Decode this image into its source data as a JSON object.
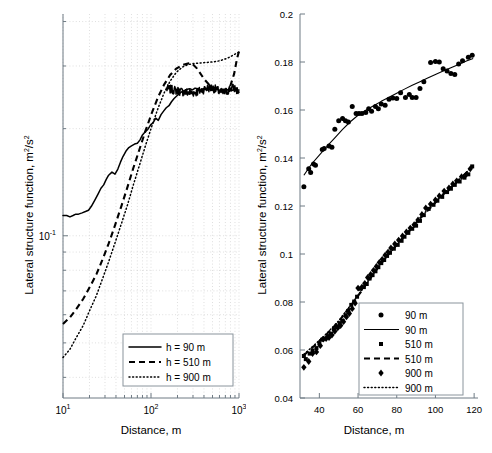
{
  "figure": {
    "panels": [
      "left-loglog-panel",
      "right-linear-panel"
    ]
  },
  "left_panel": {
    "xlabel": "Distance, m",
    "ylabel": "Lateral structure function, m",
    "ylabel_exp": "2",
    "ylabel_tail": "/s",
    "ylabel_exp2": "2",
    "xticks": [
      "10",
      "10",
      "10"
    ],
    "xtick_exps": [
      "1",
      "2",
      "3"
    ],
    "ytick": "10",
    "ytick_exp": "-1",
    "legend": [
      {
        "label": "h =  90 m",
        "style": "solid"
      },
      {
        "label": "h = 510 m",
        "style": "dashed"
      },
      {
        "label": "h = 900 m",
        "style": "dotted"
      }
    ]
  },
  "right_panel": {
    "xlabel": "Distance, m",
    "ylabel": "Lateral structure function, m",
    "ylabel_exp": "2",
    "ylabel_tail": "/s",
    "ylabel_exp2": "2",
    "xticks": [
      "40",
      "60",
      "80",
      "100",
      "120"
    ],
    "yticks": [
      "0.04",
      "0.06",
      "0.08",
      "0.1",
      "0.12",
      "0.14",
      "0.16",
      "0.18",
      "0.2"
    ],
    "legend": [
      {
        "label": "90 m",
        "style": "circle-marker"
      },
      {
        "label": "90 m",
        "style": "solid"
      },
      {
        "label": "510 m",
        "style": "square-marker"
      },
      {
        "label": "510 m",
        "style": "dashed"
      },
      {
        "label": "900 m",
        "style": "diamond-marker"
      },
      {
        "label": "900 m",
        "style": "dotted"
      }
    ]
  },
  "chart_data": [
    {
      "type": "line",
      "id": "left-loglog",
      "title": "",
      "xlabel": "Distance, m",
      "ylabel": "Lateral structure function, m^2/s^2",
      "xscale": "log",
      "yscale": "log",
      "xlim": [
        10,
        1000
      ],
      "ylim": [
        0.035,
        0.42
      ],
      "grid": true,
      "legend_position": "lower-right",
      "series": [
        {
          "name": "h =  90 m",
          "style": "solid",
          "x": [
            10,
            11,
            12,
            13,
            14,
            15,
            16.5,
            18,
            19.5,
            21,
            23,
            25,
            27,
            29,
            31,
            33,
            36,
            39,
            42,
            45,
            48,
            52,
            56,
            60,
            65,
            70,
            75,
            80,
            86,
            92,
            99,
            106,
            113,
            121,
            130,
            139,
            149,
            160,
            171,
            183,
            196,
            210,
            225,
            241,
            258,
            276,
            296,
            317,
            340,
            364,
            390,
            418,
            447,
            479,
            513,
            550,
            589,
            631,
            676,
            724,
            776,
            831,
            891,
            955,
            1000
          ],
          "y": [
            0.114,
            0.114,
            0.113,
            0.114,
            0.115,
            0.115,
            0.116,
            0.117,
            0.118,
            0.121,
            0.126,
            0.131,
            0.136,
            0.139,
            0.144,
            0.148,
            0.151,
            0.149,
            0.154,
            0.161,
            0.167,
            0.173,
            0.177,
            0.179,
            0.181,
            0.182,
            0.186,
            0.192,
            0.196,
            0.199,
            0.205,
            0.208,
            0.214,
            0.211,
            0.219,
            0.224,
            0.229,
            0.232,
            0.238,
            0.243,
            0.247,
            0.251,
            0.254,
            0.256,
            0.258,
            0.259,
            0.257,
            0.26,
            0.259,
            0.256,
            0.258,
            0.26,
            0.257,
            0.259,
            0.256,
            0.258,
            0.257,
            0.255,
            0.258,
            0.256,
            0.259,
            0.256,
            0.258,
            0.257,
            0.257
          ]
        },
        {
          "name": "h = 510 m",
          "style": "dashed",
          "x": [
            10,
            12,
            14,
            17,
            20,
            24,
            28,
            33,
            39,
            46,
            54,
            63,
            74,
            87,
            102,
            120,
            141,
            165,
            194,
            228,
            267,
            300,
            330,
            360,
            400,
            450,
            500,
            560,
            620,
            700,
            790,
            880,
            950,
            1000
          ],
          "y": [
            0.0565,
            0.059,
            0.062,
            0.0665,
            0.0715,
            0.078,
            0.0855,
            0.095,
            0.107,
            0.121,
            0.137,
            0.155,
            0.175,
            0.198,
            0.221,
            0.245,
            0.266,
            0.283,
            0.295,
            0.302,
            0.305,
            0.303,
            0.296,
            0.287,
            0.276,
            0.267,
            0.262,
            0.259,
            0.257,
            0.256,
            0.262,
            0.285,
            0.315,
            0.33
          ]
        },
        {
          "name": "h = 900 m",
          "style": "dotted",
          "x": [
            10,
            12,
            14,
            17,
            20,
            24,
            28,
            33,
            39,
            46,
            54,
            63,
            74,
            87,
            102,
            120,
            141,
            165,
            194,
            228,
            267,
            313,
            367,
            430,
            500,
            560,
            620,
            700,
            790,
            880,
            950,
            1000
          ],
          "y": [
            0.0455,
            0.048,
            0.0515,
            0.056,
            0.0615,
            0.068,
            0.0755,
            0.0845,
            0.0955,
            0.108,
            0.122,
            0.139,
            0.158,
            0.18,
            0.203,
            0.228,
            0.252,
            0.272,
            0.288,
            0.298,
            0.303,
            0.305,
            0.306,
            0.307,
            0.308,
            0.309,
            0.311,
            0.314,
            0.318,
            0.323,
            0.326,
            0.328
          ]
        }
      ]
    },
    {
      "type": "scatter",
      "id": "right-linear",
      "title": "",
      "xlabel": "Distance, m",
      "ylabel": "Lateral structure function, m^2/s^2",
      "xscale": "linear",
      "yscale": "linear",
      "xlim": [
        30,
        122
      ],
      "ylim": [
        0.04,
        0.2
      ],
      "grid": false,
      "legend_position": "lower-right",
      "series": [
        {
          "name": "90 m",
          "style": "circle-marker",
          "x": [
            32,
            34.5,
            35.5,
            37,
            38,
            41.5,
            42.5,
            45,
            46.5,
            48,
            50,
            52,
            53.5,
            55,
            57,
            59,
            60.5,
            62,
            64,
            65.5,
            67,
            69,
            70.5,
            72,
            74,
            76,
            78,
            80,
            82,
            84.5,
            86.5,
            88,
            90,
            92,
            94,
            97.5,
            100,
            102,
            104,
            106,
            108,
            110,
            112,
            114,
            117,
            119
          ],
          "y": [
            0.128,
            0.1355,
            0.134,
            0.1375,
            0.137,
            0.1435,
            0.144,
            0.145,
            0.1445,
            0.152,
            0.1555,
            0.1565,
            0.1555,
            0.155,
            0.1615,
            0.1585,
            0.1585,
            0.1585,
            0.159,
            0.1605,
            0.1595,
            0.1615,
            0.1605,
            0.1625,
            0.162,
            0.1645,
            0.165,
            0.1648,
            0.1672,
            0.1652,
            0.1665,
            0.1652,
            0.1652,
            0.169,
            0.1718,
            0.1798,
            0.1802,
            0.18,
            0.1772,
            0.1762,
            0.1752,
            0.1748,
            0.1792,
            0.1805,
            0.182,
            0.1828
          ]
        },
        {
          "name": "90 m",
          "style": "solid",
          "x": [
            32,
            36,
            40,
            44,
            48,
            52,
            56,
            60,
            64,
            68,
            72,
            76,
            80,
            84,
            88,
            92,
            96,
            100,
            104,
            108,
            112,
            116,
            119.5
          ],
          "y": [
            0.1328,
            0.1375,
            0.1412,
            0.1449,
            0.1484,
            0.1519,
            0.1551,
            0.1578,
            0.1599,
            0.1618,
            0.1636,
            0.1653,
            0.167,
            0.1687,
            0.1703,
            0.1718,
            0.1733,
            0.1748,
            0.1762,
            0.1776,
            0.179,
            0.1804,
            0.1815
          ]
        },
        {
          "name": "510 m",
          "style": "square-marker",
          "x": [
            32,
            33,
            35,
            36.5,
            38.5,
            40,
            41.5,
            43,
            44.5,
            46,
            47.5,
            49,
            50.5,
            52,
            53.5,
            55,
            56.5,
            58,
            59.5,
            61,
            63,
            64.5,
            66,
            67.5,
            69,
            70.5,
            72,
            73.5,
            75,
            76.5,
            78.5,
            80.5,
            82.5,
            84,
            86,
            88,
            90,
            92,
            94,
            96.5,
            99,
            101,
            103.5,
            106,
            108,
            110,
            112.5,
            115,
            117,
            119
          ],
          "y": [
            0.0575,
            0.0562,
            0.0585,
            0.0598,
            0.0608,
            0.0628,
            0.0643,
            0.0648,
            0.0658,
            0.0668,
            0.0687,
            0.0697,
            0.0712,
            0.0722,
            0.0745,
            0.0763,
            0.0788,
            0.0802,
            0.0822,
            0.0855,
            0.0862,
            0.0875,
            0.0898,
            0.0912,
            0.0928,
            0.0945,
            0.0962,
            0.0975,
            0.0992,
            0.1005,
            0.1022,
            0.1038,
            0.1055,
            0.1072,
            0.1088,
            0.1105,
            0.1118,
            0.1138,
            0.1162,
            0.1188,
            0.1205,
            0.1222,
            0.1238,
            0.1258,
            0.1272,
            0.1288,
            0.1302,
            0.1318,
            0.1332,
            0.1365
          ]
        },
        {
          "name": "510 m",
          "style": "dashed",
          "x": [
            32,
            38,
            44,
            50,
            56,
            62,
            68,
            74,
            80,
            86,
            92,
            98,
            104,
            110,
            116,
            119.5
          ],
          "y": [
            0.0578,
            0.0622,
            0.0668,
            0.0718,
            0.0782,
            0.0848,
            0.0918,
            0.0982,
            0.1038,
            0.1092,
            0.1148,
            0.1198,
            0.1248,
            0.1292,
            0.1338,
            0.1368
          ]
        },
        {
          "name": "900 m",
          "style": "diamond-marker",
          "x": [
            32,
            34.5,
            36.5,
            38.5,
            40.5,
            42,
            43.5,
            45,
            46.5,
            48,
            49.5,
            51,
            52.5,
            54,
            55.5,
            57,
            58.5,
            60,
            62,
            63.5,
            65,
            66.5,
            68,
            69.5,
            71,
            72.5,
            74,
            75.5,
            77,
            79,
            81,
            83,
            85,
            87,
            89,
            91,
            93,
            95,
            97.5,
            100,
            102,
            104.5,
            107,
            109,
            111,
            113.5,
            116,
            118
          ],
          "y": [
            0.0528,
            0.0552,
            0.0585,
            0.0592,
            0.0618,
            0.0645,
            0.0648,
            0.0652,
            0.0662,
            0.0678,
            0.0692,
            0.0702,
            0.0718,
            0.0738,
            0.0752,
            0.0772,
            0.0795,
            0.0858,
            0.0862,
            0.0878,
            0.0902,
            0.0915,
            0.0932,
            0.0948,
            0.0965,
            0.0978,
            0.0995,
            0.1008,
            0.1025,
            0.1042,
            0.1058,
            0.1075,
            0.1092,
            0.1108,
            0.1122,
            0.1142,
            0.1165,
            0.1192,
            0.1208,
            0.1225,
            0.1242,
            0.1262,
            0.1275,
            0.1292,
            0.1305,
            0.1322,
            0.1332,
            0.1355
          ]
        },
        {
          "name": "900 m",
          "style": "dotted",
          "x": [
            32,
            38,
            44,
            50,
            56,
            62,
            68,
            74,
            80,
            86,
            92,
            98,
            104,
            110,
            116,
            119.5
          ],
          "y": [
            0.0582,
            0.0625,
            0.067,
            0.0722,
            0.0785,
            0.085,
            0.0918,
            0.098,
            0.1038,
            0.1095,
            0.115,
            0.1202,
            0.125,
            0.1295,
            0.134,
            0.1368
          ]
        }
      ]
    }
  ]
}
